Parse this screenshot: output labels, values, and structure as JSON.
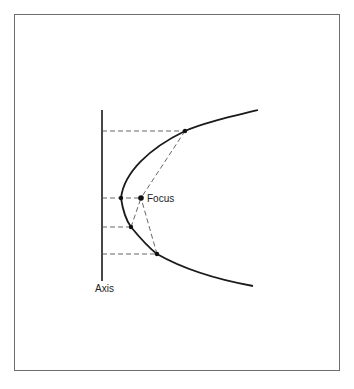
{
  "diagram": {
    "labels": {
      "focus": "Focus",
      "axis": "Axis"
    },
    "colors": {
      "stroke": "#1a1a1a",
      "dash": "#555555",
      "frame": "#6e6e6e"
    },
    "points": {
      "vertex": [
        121,
        198
      ],
      "focus": [
        141,
        198
      ],
      "upper": [
        185,
        130
      ],
      "lower_near": [
        131,
        227
      ],
      "lower_far": [
        157,
        254
      ]
    }
  }
}
